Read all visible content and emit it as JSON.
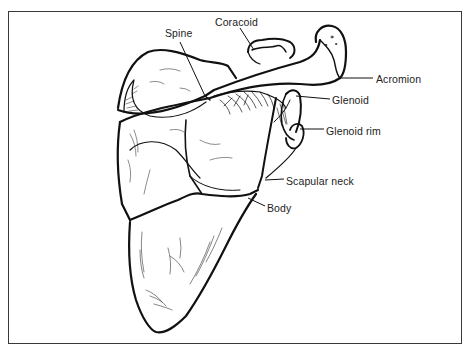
{
  "diagram": {
    "labels": [
      {
        "id": "spine",
        "text": "Spine",
        "x": 165,
        "y": 27
      },
      {
        "id": "coracoid",
        "text": "Coracoid",
        "x": 215,
        "y": 16
      },
      {
        "id": "acromion",
        "text": "Acromion",
        "x": 376,
        "y": 73
      },
      {
        "id": "glenoid",
        "text": "Glenoid",
        "x": 332,
        "y": 94
      },
      {
        "id": "glenoid-rim",
        "text": "Glenoid rim",
        "x": 326,
        "y": 125
      },
      {
        "id": "scapular-neck",
        "text": "Scapular neck",
        "x": 286,
        "y": 175
      },
      {
        "id": "body",
        "text": "Body",
        "x": 267,
        "y": 202
      }
    ],
    "colors": {
      "ink": "#111111",
      "frame": "#3a3a3a",
      "background": "#ffffff",
      "label": "#222222"
    }
  }
}
